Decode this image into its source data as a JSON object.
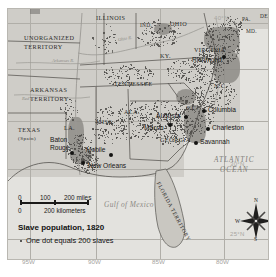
{
  "map": {
    "title": "Slave population, 1820",
    "legend_note": "One dot equals 200 slaves",
    "scale": {
      "miles_0": "0",
      "miles_100": "100",
      "miles_200": "200 miles",
      "km_0": "0",
      "km_200": "200 kilometers"
    },
    "compass": {
      "n": "N",
      "s": "S",
      "e": "E",
      "w": "W"
    },
    "oceans": [
      {
        "name": "ATLANTIC",
        "line2": "OCEAN"
      },
      {
        "name": "Gulf of Mexico"
      }
    ],
    "territories": [
      {
        "label": "UNORGANIZED",
        "line2": "TERRITORY"
      },
      {
        "label": "ARKANSAS",
        "line2": "TERRITORY"
      },
      {
        "label": "TEXAS",
        "line2": "(Spain)"
      },
      {
        "label": "FLORIDA TERRITORY"
      }
    ],
    "states": [
      {
        "label": "ILLINOIS"
      },
      {
        "label": "IND."
      },
      {
        "label": "OHIO"
      },
      {
        "label": "PA."
      },
      {
        "label": "DEL."
      },
      {
        "label": "MD."
      },
      {
        "label": "KY."
      },
      {
        "label": "VIRGINIA"
      },
      {
        "label": "N.C."
      },
      {
        "label": "S.C."
      },
      {
        "label": "TENNESSEE"
      },
      {
        "label": "GEORGIA"
      },
      {
        "label": "ALA."
      },
      {
        "label": "MISS."
      },
      {
        "label": "LA."
      }
    ],
    "cities": [
      {
        "label": "Richmond"
      },
      {
        "label": "Columbia"
      },
      {
        "label": "Charleston"
      },
      {
        "label": "Savannah"
      },
      {
        "label": "Augusta"
      },
      {
        "label": "Macon"
      },
      {
        "label": "Mobile"
      },
      {
        "label": "New Orleans"
      },
      {
        "label": "Baton",
        "line2": "Rouge"
      }
    ],
    "rivers": [
      {
        "label": "Arkansas R."
      },
      {
        "label": "Red R."
      },
      {
        "label": "Ohio R."
      }
    ],
    "latitudes": [
      {
        "label": "40°N"
      },
      {
        "label": "30°N"
      },
      {
        "label": "25°N"
      }
    ],
    "longitudes": [
      {
        "label": "95W"
      },
      {
        "label": "90W"
      },
      {
        "label": "85W"
      },
      {
        "label": "80W"
      }
    ],
    "colors": {
      "land": "#c9c7c1",
      "water": "#e3e2de",
      "dense_shading": "#8e8c87",
      "dot": "#4e4c49",
      "city_dot": "#141312",
      "coordinate_text": "#a7a5a0"
    }
  }
}
